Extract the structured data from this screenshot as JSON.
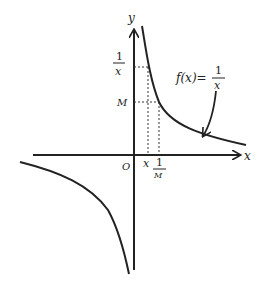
{
  "diagram": {
    "axes": {
      "x_label": "x",
      "y_label": "y",
      "origin_label": "O"
    },
    "function_label": {
      "lhs": "f(x)=",
      "numerator": "1",
      "denominator": "x"
    },
    "y_ticks": [
      {
        "numerator": "1",
        "denominator": "x"
      },
      {
        "label": "M"
      }
    ],
    "x_ticks": [
      {
        "label": "x"
      },
      {
        "numerator": "1",
        "denominator": "M"
      }
    ],
    "colors": {
      "stroke": "#222222",
      "background": "#ffffff"
    }
  }
}
